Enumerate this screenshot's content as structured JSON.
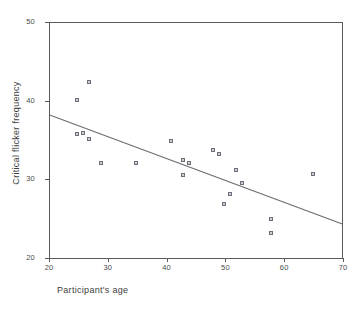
{
  "chart_data": {
    "type": "scatter",
    "title": "",
    "xlabel": "Participant's age",
    "ylabel": "Critical flicker frequency",
    "xlim": [
      20,
      70
    ],
    "ylim": [
      20,
      50
    ],
    "xticks": [
      20,
      30,
      40,
      50,
      60,
      70
    ],
    "yticks": [
      20,
      30,
      40,
      50
    ],
    "grid": false,
    "legend": null,
    "marker": "open-square",
    "points": [
      {
        "x": 25,
        "y": 39.9
      },
      {
        "x": 27,
        "y": 42.2
      },
      {
        "x": 25,
        "y": 35.6
      },
      {
        "x": 26,
        "y": 35.8
      },
      {
        "x": 27,
        "y": 35.0
      },
      {
        "x": 29,
        "y": 32.0
      },
      {
        "x": 35,
        "y": 32.0
      },
      {
        "x": 41,
        "y": 34.8
      },
      {
        "x": 43,
        "y": 32.3
      },
      {
        "x": 43,
        "y": 30.4
      },
      {
        "x": 44,
        "y": 32.0
      },
      {
        "x": 48,
        "y": 33.6
      },
      {
        "x": 49,
        "y": 33.1
      },
      {
        "x": 50,
        "y": 26.8
      },
      {
        "x": 51,
        "y": 28.0
      },
      {
        "x": 52,
        "y": 31.1
      },
      {
        "x": 53,
        "y": 29.4
      },
      {
        "x": 58,
        "y": 24.8
      },
      {
        "x": 58,
        "y": 23.1
      },
      {
        "x": 65,
        "y": 30.5
      }
    ],
    "trendline": {
      "x_start": 20,
      "y_start": 38.2,
      "x_end": 70,
      "y_end": 24.3,
      "color": "#6a6a72"
    },
    "axis_color": "#5a5a5a",
    "marker_fill": "#cfcfd6",
    "marker_stroke": "#6e6e78",
    "background": "#ffffff"
  }
}
